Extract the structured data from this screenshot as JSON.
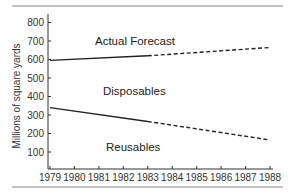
{
  "chart_data": {
    "type": "line",
    "title": "",
    "xlabel": "",
    "ylabel": "Millions of square yards",
    "x": [
      1979,
      1980,
      1981,
      1982,
      1983,
      1984,
      1985,
      1986,
      1987,
      1988
    ],
    "xlim": [
      1979,
      1988
    ],
    "ylim": [
      0,
      850
    ],
    "yticks": [
      100,
      200,
      300,
      400,
      500,
      600,
      700,
      800
    ],
    "grid": false,
    "legend": "none",
    "series": [
      {
        "name": "Disposables",
        "actual": {
          "x": [
            1979,
            1983
          ],
          "y": [
            595,
            620
          ]
        },
        "forecast": {
          "x": [
            1983,
            1988
          ],
          "y": [
            620,
            665
          ]
        }
      },
      {
        "name": "Reusables",
        "actual": {
          "x": [
            1979,
            1983
          ],
          "y": [
            340,
            265
          ]
        },
        "forecast": {
          "x": [
            1983,
            1988
          ],
          "y": [
            265,
            165
          ]
        }
      }
    ],
    "annotations": [
      "Actual Forecast",
      "Disposables",
      "Reusables"
    ]
  },
  "labels": {
    "ylabel": "Millions of square yards",
    "actual_forecast": "Actual Forecast",
    "disposables": "Disposables",
    "reusables": "Reusables"
  }
}
